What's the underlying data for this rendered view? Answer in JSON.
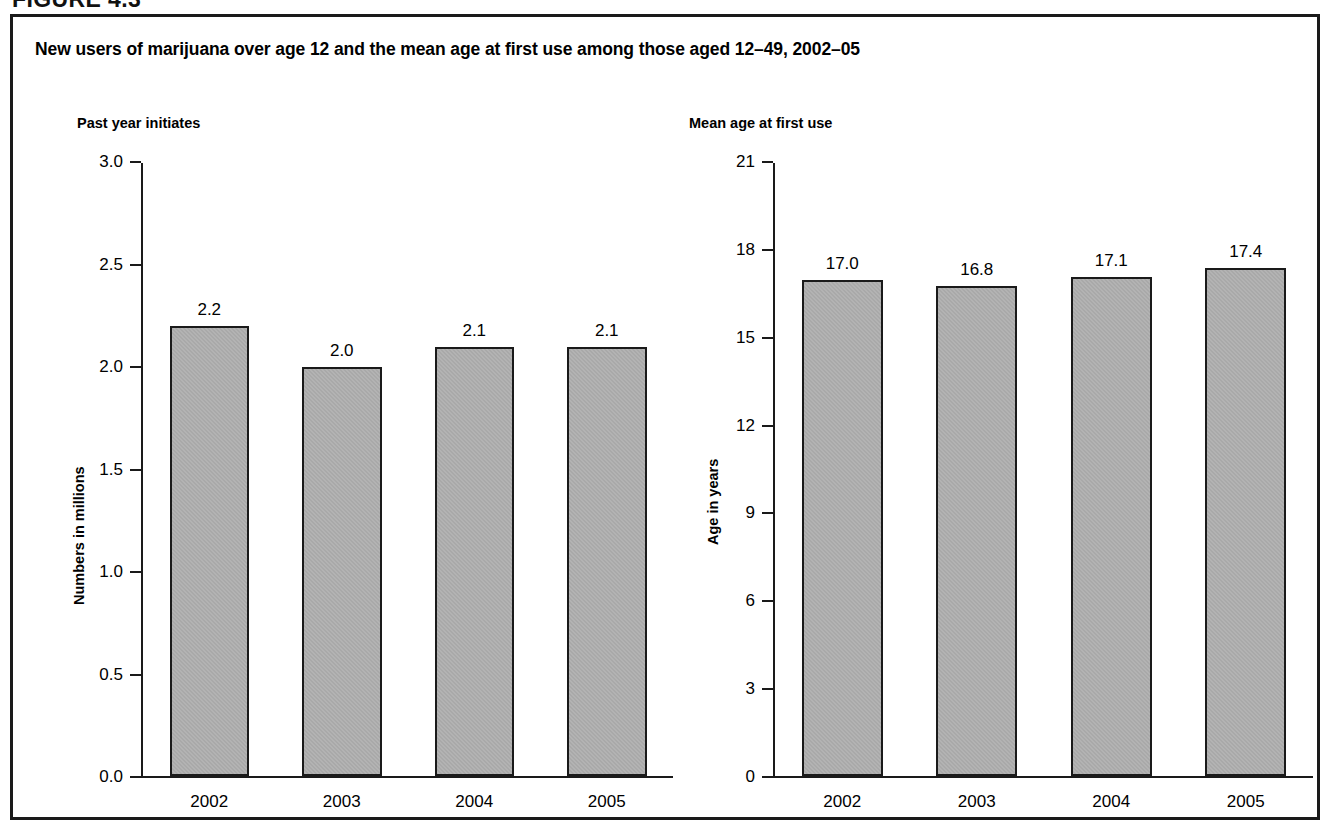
{
  "figure": {
    "label": "FIGURE 4.3",
    "title": "New users of marijuana over age 12 and the mean age at first use among those aged 12–49, 2002–05"
  },
  "chart_data": [
    {
      "type": "bar",
      "title": "Past year initiates",
      "xlabel": "",
      "ylabel": "Numbers in millions",
      "categories": [
        "2002",
        "2003",
        "2004",
        "2005"
      ],
      "values": [
        2.2,
        2.0,
        2.1,
        2.1
      ],
      "value_labels": [
        "2.2",
        "2.0",
        "2.1",
        "2.1"
      ],
      "ylim": [
        0.0,
        3.0
      ],
      "yticks": [
        3.0,
        2.5,
        2.0,
        1.5,
        1.0,
        0.5,
        0.0
      ],
      "ytick_labels": [
        "3.0",
        "2.5",
        "2.0",
        "1.5",
        "1.0",
        "0.5",
        "0.0"
      ],
      "grid": false,
      "legend": "none",
      "bar_color": "#a9a9a9",
      "bar_edge_color": "#1a1a1a"
    },
    {
      "type": "bar",
      "title": "Mean age at first use",
      "xlabel": "",
      "ylabel": "Age in years",
      "categories": [
        "2002",
        "2003",
        "2004",
        "2005"
      ],
      "values": [
        17.0,
        16.8,
        17.1,
        17.4
      ],
      "value_labels": [
        "17.0",
        "16.8",
        "17.1",
        "17.4"
      ],
      "ylim": [
        0,
        21
      ],
      "yticks": [
        21,
        18,
        15,
        12,
        9,
        6,
        3,
        0
      ],
      "ytick_labels": [
        "21",
        "18",
        "15",
        "12",
        "9",
        "6",
        "3",
        "0"
      ],
      "grid": false,
      "legend": "none",
      "bar_color": "#a9a9a9",
      "bar_edge_color": "#1a1a1a"
    }
  ]
}
